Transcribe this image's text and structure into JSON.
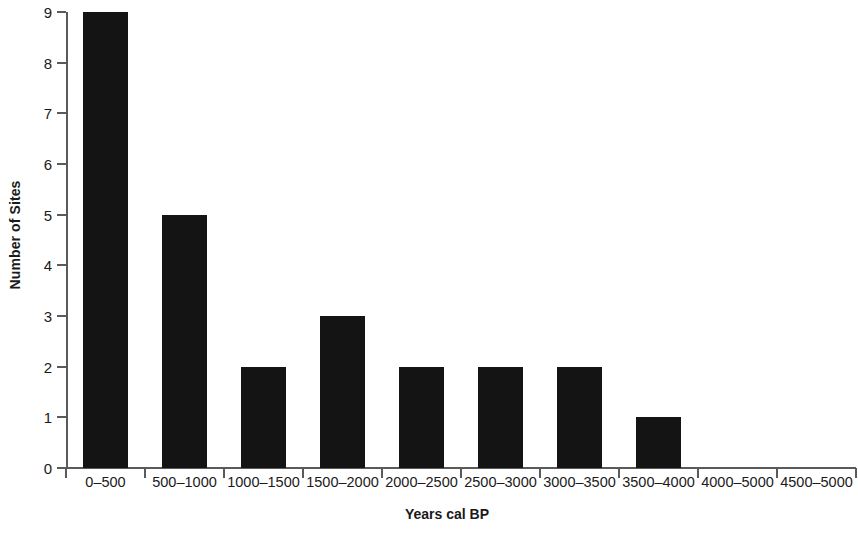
{
  "chart_data": {
    "type": "bar",
    "title": "",
    "xlabel": "Years cal BP",
    "ylabel": "Number of Sites",
    "categories": [
      "0–500",
      "500–1000",
      "1000–1500",
      "1500–2000",
      "2000–2500",
      "2500–3000",
      "3000–3500",
      "3500–4000",
      "4000–5000",
      "4500–5000"
    ],
    "values": [
      9,
      5,
      2,
      3,
      2,
      2,
      2,
      1,
      0,
      0
    ],
    "ylim": [
      0,
      9
    ],
    "ytick_labels": [
      "0",
      "1",
      "2",
      "3",
      "4",
      "5",
      "6",
      "7",
      "8",
      "9"
    ],
    "ytick_values": [
      0,
      1,
      2,
      3,
      4,
      5,
      6,
      7,
      8,
      9
    ],
    "grid": false,
    "legend": false,
    "bar_color": "#141414",
    "axis_color": "#5a5a5a",
    "background_color": "#ffffff"
  }
}
